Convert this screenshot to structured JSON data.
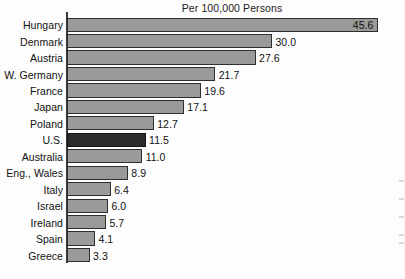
{
  "chart_data": {
    "type": "bar",
    "orientation": "horizontal",
    "title": "Per 100,000 Persons",
    "xlabel": "",
    "ylabel": "",
    "grid": false,
    "legend": null,
    "xlim": [
      0,
      45.6
    ],
    "axis_origin_value": 0,
    "categories": [
      "Hungary",
      "Denmark",
      "Austria",
      "W. Germany",
      "France",
      "Japan",
      "Poland",
      "U.S.",
      "Australia",
      "Eng., Wales",
      "Italy",
      "Israel",
      "Ireland",
      "Spain",
      "Greece"
    ],
    "values": [
      45.6,
      30.0,
      27.6,
      21.7,
      19.6,
      17.1,
      12.7,
      11.5,
      11.0,
      8.9,
      6.4,
      6.0,
      5.7,
      4.1,
      3.3
    ],
    "value_labels": [
      "45.6",
      "30.0",
      "27.6",
      "21.7",
      "19.6",
      "17.1",
      "12.7",
      "11.5",
      "11.0",
      "8.9",
      "6.4",
      "6.0",
      "5.7",
      "4.1",
      "3.3"
    ],
    "highlighted_category": "U.S.",
    "colors": {
      "bar_fill": "#9a9a9a",
      "bar_border": "#2f2f2f",
      "highlight_fill": "#2b2b2b",
      "highlight_border": "#141414",
      "axis": "#3a3a3a",
      "text": "#111111",
      "background": "#fdfdfd"
    },
    "bars": [
      {
        "category": "Hungary",
        "value": 45.6,
        "label": "45.6",
        "highlighted": false,
        "label_position": "inside"
      },
      {
        "category": "Denmark",
        "value": 30.0,
        "label": "30.0",
        "highlighted": false,
        "label_position": "outside"
      },
      {
        "category": "Austria",
        "value": 27.6,
        "label": "27.6",
        "highlighted": false,
        "label_position": "outside"
      },
      {
        "category": "W. Germany",
        "value": 21.7,
        "label": "21.7",
        "highlighted": false,
        "label_position": "outside"
      },
      {
        "category": "France",
        "value": 19.6,
        "label": "19.6",
        "highlighted": false,
        "label_position": "outside"
      },
      {
        "category": "Japan",
        "value": 17.1,
        "label": "17.1",
        "highlighted": false,
        "label_position": "outside"
      },
      {
        "category": "Poland",
        "value": 12.7,
        "label": "12.7",
        "highlighted": false,
        "label_position": "outside"
      },
      {
        "category": "U.S.",
        "value": 11.5,
        "label": "11.5",
        "highlighted": true,
        "label_position": "outside"
      },
      {
        "category": "Australia",
        "value": 11.0,
        "label": "11.0",
        "highlighted": false,
        "label_position": "outside"
      },
      {
        "category": "Eng., Wales",
        "value": 8.9,
        "label": "8.9",
        "highlighted": false,
        "label_position": "outside"
      },
      {
        "category": "Italy",
        "value": 6.4,
        "label": "6.4",
        "highlighted": false,
        "label_position": "outside"
      },
      {
        "category": "Israel",
        "value": 6.0,
        "label": "6.0",
        "highlighted": false,
        "label_position": "outside"
      },
      {
        "category": "Ireland",
        "value": 5.7,
        "label": "5.7",
        "highlighted": false,
        "label_position": "outside"
      },
      {
        "category": "Spain",
        "value": 4.1,
        "label": "4.1",
        "highlighted": false,
        "label_position": "outside"
      },
      {
        "category": "Greece",
        "value": 3.3,
        "label": "3.3",
        "highlighted": false,
        "label_position": "outside"
      }
    ]
  },
  "layout": {
    "axis_x_px": 67,
    "px_per_unit": 6.83,
    "row_height_px": 16.45,
    "plot_top_px": 17
  }
}
